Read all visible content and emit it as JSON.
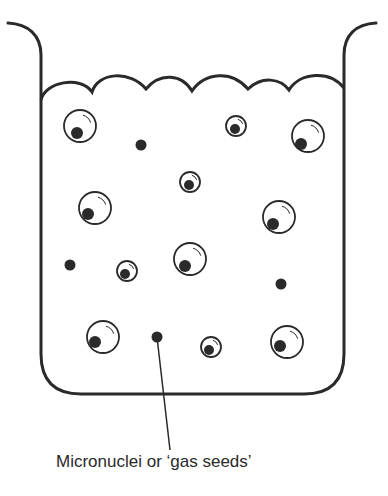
{
  "diagram": {
    "label": "Micronuclei or ‘gas seeds’",
    "colors": {
      "stroke": "#2a2a2a",
      "background": "#ffffff"
    },
    "bubbles": [
      {
        "cx": 80,
        "cy": 126,
        "r": 16,
        "dx": 77,
        "dy": 133
      },
      {
        "cx": 236,
        "cy": 126,
        "r": 10,
        "dx": 235,
        "dy": 129
      },
      {
        "cx": 308,
        "cy": 136,
        "r": 16,
        "dx": 301,
        "dy": 144
      },
      {
        "cx": 190,
        "cy": 182,
        "r": 10,
        "dx": 189,
        "dy": 185
      },
      {
        "cx": 95,
        "cy": 208,
        "r": 16,
        "dx": 88,
        "dy": 214
      },
      {
        "cx": 279,
        "cy": 217,
        "r": 16,
        "dx": 273,
        "dy": 224
      },
      {
        "cx": 127,
        "cy": 271,
        "r": 10,
        "dx": 125,
        "dy": 274
      },
      {
        "cx": 190,
        "cy": 259,
        "r": 16,
        "dx": 185,
        "dy": 266
      },
      {
        "cx": 103,
        "cy": 337,
        "r": 16,
        "dx": 95,
        "dy": 342
      },
      {
        "cx": 211,
        "cy": 347,
        "r": 10,
        "dx": 209,
        "dy": 350
      },
      {
        "cx": 287,
        "cy": 342,
        "r": 16,
        "dx": 280,
        "dy": 346
      }
    ],
    "micronuclei": [
      {
        "cx": 141,
        "cy": 145
      },
      {
        "cx": 70,
        "cy": 265
      },
      {
        "cx": 281,
        "cy": 284
      },
      {
        "cx": 157,
        "cy": 337
      }
    ],
    "leader": {
      "x1": 157,
      "y1": 337,
      "x2": 170,
      "y2": 450
    }
  }
}
